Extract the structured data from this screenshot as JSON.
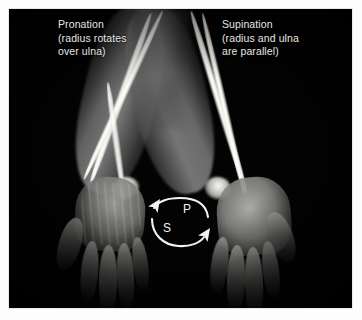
{
  "figure": {
    "type": "anatomical-photograph-with-radiograph-overlay",
    "background_color": "#000000",
    "mount_color": "#fdfdfd",
    "annotation_text_color": "#e6e6e2"
  },
  "annotations": {
    "left": {
      "term": "Pronation",
      "detail": "(radius rotates\nover ulna)",
      "full_text": "Pronation\n(radius rotates\nover ulna)"
    },
    "right": {
      "term": "Supination",
      "detail": "(radius and ulna\nare parallel)",
      "full_text": "Supination\n(radius and ulna\nare parallel)"
    }
  },
  "rotation_diagram": {
    "pronation_marker": "P",
    "supination_marker": "S",
    "arrow_color": "#f2f2ee",
    "pronation_direction": "right-to-left across top",
    "supination_direction": "left-to-right across bottom"
  },
  "anatomy": {
    "left_arm": {
      "state": "pronated",
      "hand_view": "dorsal",
      "bone_arrangement": "radius crosses over ulna"
    },
    "right_arm": {
      "state": "supinated",
      "hand_view": "palmar",
      "bone_arrangement": "radius and ulna parallel"
    }
  }
}
